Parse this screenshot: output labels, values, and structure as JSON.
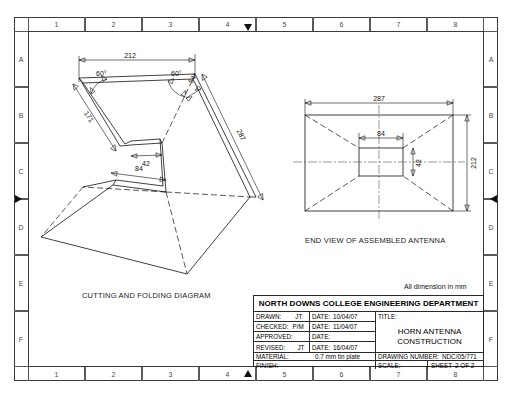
{
  "frame": {
    "columns": [
      "1",
      "2",
      "3",
      "4",
      "5",
      "6",
      "7",
      "8"
    ],
    "rows": [
      "A",
      "B",
      "C",
      "D",
      "E",
      "F"
    ]
  },
  "note": {
    "dimensions_note": "All dimension in mm"
  },
  "cutting_diagram": {
    "caption": "CUTTING AND FOLDING DIAGRAM",
    "dimensions": {
      "top_width": "212",
      "left_angle": "60°",
      "right_angle": "60°",
      "corner_angle": "54°",
      "left_side": "171",
      "right_side": "287",
      "throat_small": "42",
      "throat_large": "84"
    }
  },
  "end_view": {
    "caption": "END VIEW OF ASSEMBLED ANTENNA",
    "dimensions": {
      "outer_width": "287",
      "outer_height": "212",
      "inner_width": "84",
      "inner_height": "42"
    }
  },
  "title_block": {
    "department": "NORTH DOWNS COLLEGE ENGINEERING DEPARTMENT",
    "rows": [
      {
        "label": "DRAWN:",
        "value": "JT",
        "date_label": "DATE:",
        "date": "10/04/07"
      },
      {
        "label": "CHECKED:",
        "value": "P/M",
        "date_label": "DATE:",
        "date": "11/04/07"
      },
      {
        "label": "APPROVED:",
        "value": "",
        "date_label": "DATE:",
        "date": ""
      },
      {
        "label": "REVISED:",
        "value": "JT",
        "date_label": "DATE:",
        "date": "16/04/07"
      }
    ],
    "title_label": "TITLE:",
    "title_line1": "HORN ANTENNA",
    "title_line2": "CONSTRUCTION",
    "material_label": "MATERIAL:",
    "material_value": "0.7 mm tin plate",
    "drawing_number_label": "DRAWING NUMBER:",
    "drawing_number_value": "NDC/05/771",
    "finish_label": "FINISH:",
    "scale_label": "SCALE:",
    "scale_value": "",
    "sheet_label": "SHEET",
    "sheet_value": "2 OF  2"
  }
}
